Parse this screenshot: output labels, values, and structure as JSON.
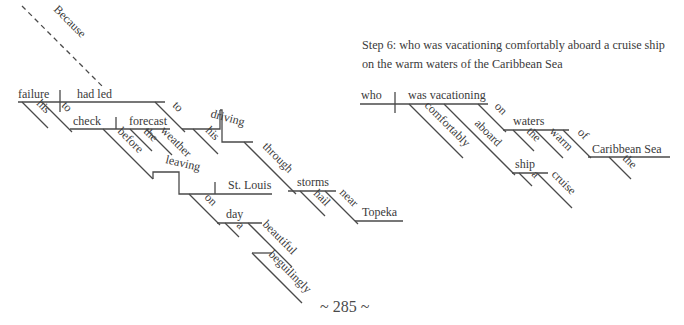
{
  "caption": {
    "line1": "Step 6: who was vacationing comfortably aboard a cruise ship",
    "line2": "on the warm waters of the Caribbean Sea"
  },
  "page_number": "~ 285 ~",
  "left_diagram": {
    "subordinator": "Because",
    "subject": "failure",
    "subject_modifier": "his",
    "verb": "had led",
    "infinitive_marker": "to",
    "infinitive_verb": "check",
    "infinitive_object": "forecast",
    "object_modifiers": [
      "the",
      "weather"
    ],
    "preposition_before": "before",
    "gerund": "leaving",
    "gerund_object": "St. Louis",
    "gerund_preposition": "on",
    "prep_object_day": "day",
    "day_modifiers": [
      "a",
      "beautiful"
    ],
    "adverb_beguilingly": "beguilingly",
    "preposition_to": "to",
    "gerund_driving": "driving",
    "driving_modifier": "his",
    "preposition_through": "through",
    "prep_object_storms": "storms",
    "storms_modifier": "hail",
    "preposition_near": "near",
    "prep_object_topeka": "Topeka"
  },
  "right_diagram": {
    "subject": "who",
    "verb": "was vacationing",
    "adverb": "comfortably",
    "preposition_aboard": "aboard",
    "prep_object_ship": "ship",
    "ship_modifiers": [
      "a",
      "cruise"
    ],
    "preposition_on": "on",
    "prep_object_waters": "waters",
    "waters_modifiers": [
      "the",
      "warm"
    ],
    "preposition_of": "of",
    "prep_object_sea": "Caribbean Sea",
    "sea_modifier": "the"
  }
}
